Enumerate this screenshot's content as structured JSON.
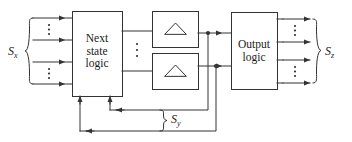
{
  "diagram": {
    "type": "block-diagram",
    "stroke_color": "#333333",
    "text_color": "#1a1a1a",
    "background": "#ffffff"
  },
  "blocks": [
    {
      "id": "next-state-logic",
      "label_lines": "Next\nstate\nlogic",
      "x": 72,
      "y": 11,
      "w": 50,
      "h": 85
    },
    {
      "id": "flipflop-top",
      "label_lines": "",
      "icon": "triangle-clock-icon",
      "x": 152,
      "y": 11,
      "w": 46,
      "h": 37
    },
    {
      "id": "flipflop-bottom",
      "label_lines": "",
      "icon": "triangle-clock-icon",
      "x": 152,
      "y": 53,
      "w": 46,
      "h": 37
    },
    {
      "id": "output-logic",
      "label_lines": "Output\nlogic",
      "x": 231,
      "y": 12,
      "w": 46,
      "h": 78
    }
  ],
  "labels": {
    "next_state_logic": "Next\nstate\nlogic",
    "output_logic": "Output\nlogic",
    "input_signal": "S",
    "input_signal_sub": "x",
    "output_signal": "S",
    "output_signal_sub": "z",
    "state_signal": "S",
    "state_signal_sub": "y"
  },
  "input_bus": {
    "name": "Sx",
    "arrow_count": 4,
    "vertical_dots_groups": 2,
    "brace": "left-brace"
  },
  "output_bus": {
    "name": "Sz",
    "arrow_count": 4,
    "vertical_dots_groups": 2,
    "brace": "right-brace"
  },
  "state_bus": {
    "name": "Sy",
    "arrow_count": 2,
    "brace": "left-brace"
  },
  "junction_dots": [
    {
      "x": 208,
      "y": 33
    },
    {
      "x": 208,
      "y": 66
    }
  ],
  "inter_block_dots": {
    "between_nsl_and_ff": 3,
    "label": "vertical-ellipsis"
  }
}
